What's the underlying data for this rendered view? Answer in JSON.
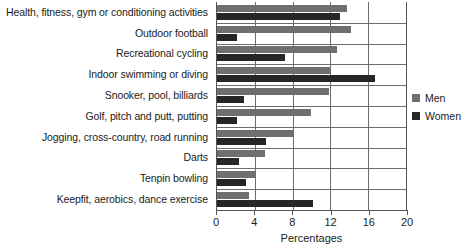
{
  "chart_data": {
    "type": "bar",
    "orientation": "horizontal",
    "title": "",
    "xlabel": "Percentages",
    "ylabel": "",
    "xlim": [
      0,
      20
    ],
    "xticks": [
      0,
      4,
      8,
      12,
      16,
      20
    ],
    "grid": true,
    "legend_position": "right",
    "categories": [
      "Health, fitness, gym or conditioning activities",
      "Outdoor football",
      "Recreational cycling",
      "Indoor swimming or diving",
      "Snooker, pool, billiards",
      "Golf, pitch and putt, putting",
      "Jogging, cross-country, road running",
      "Darts",
      "Tenpin bowling",
      "Keepfit, aerobics, dance exercise"
    ],
    "series": [
      {
        "name": "Men",
        "color": "#6f6f6f",
        "values": [
          13.8,
          14.2,
          12.7,
          12.0,
          11.9,
          9.9,
          8.1,
          5.1,
          4.1,
          3.4
        ]
      },
      {
        "name": "Women",
        "color": "#262626",
        "values": [
          13.0,
          2.1,
          7.2,
          16.7,
          2.9,
          2.1,
          5.2,
          2.3,
          3.1,
          10.2
        ]
      }
    ]
  }
}
